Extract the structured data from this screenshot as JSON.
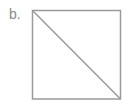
{
  "figure": {
    "label": "b.",
    "shape": "square-with-diagonal",
    "stroke_color": "#9a9a9a",
    "label_color": "#8a8a8a",
    "square": {
      "x1": 32,
      "y1": 10,
      "x2": 120,
      "y2": 99
    },
    "diagonal": {
      "from": "top-left",
      "to": "bottom-right"
    }
  }
}
